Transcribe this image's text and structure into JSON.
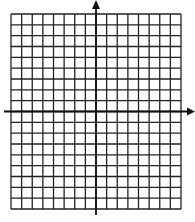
{
  "diagram": {
    "type": "coordinate-grid",
    "grid": {
      "columns": 16,
      "rows": 18,
      "left": 11,
      "top": 14,
      "right": 181,
      "bottom": 209,
      "line_color": "#222222",
      "line_width": 1.3
    },
    "axes": {
      "color": "#111111",
      "line_width": 1.8,
      "y_axis": {
        "column_index": 8,
        "top": 0,
        "bottom": 215,
        "arrow": "up"
      },
      "x_axis": {
        "row_index": 9,
        "left": 4,
        "right": 195,
        "arrow": "right"
      }
    },
    "background": "#ffffff"
  }
}
